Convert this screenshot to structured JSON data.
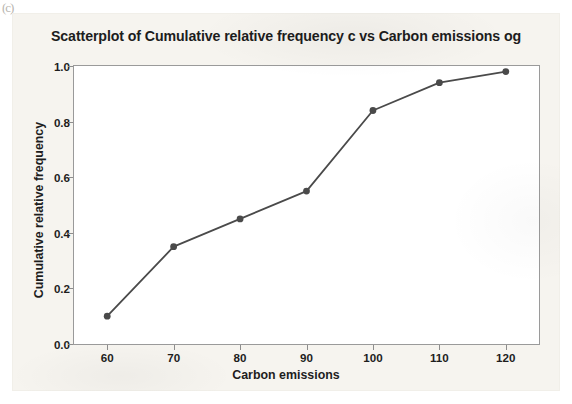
{
  "page": {
    "corner_artifact": "(c)"
  },
  "chart_data": {
    "type": "line",
    "title": "Scatterplot of Cumulative relative frequency c vs Carbon emissions og",
    "xlabel": "Carbon emissions",
    "ylabel": "Cumulative relative frequency",
    "x": [
      60,
      70,
      80,
      90,
      100,
      110,
      120
    ],
    "values": [
      0.1,
      0.35,
      0.45,
      0.55,
      0.84,
      0.94,
      0.98
    ],
    "series": [
      {
        "name": "Cumulative relative frequency",
        "values": [
          0.1,
          0.35,
          0.45,
          0.55,
          0.84,
          0.94,
          0.98
        ]
      }
    ],
    "xlim": [
      55,
      125
    ],
    "ylim": [
      0.0,
      1.0
    ],
    "xticks": [
      60,
      70,
      80,
      90,
      100,
      110,
      120
    ],
    "xticklabels": [
      "60",
      "70",
      "80",
      "90",
      "100",
      "110",
      "120"
    ],
    "yticks": [
      0.0,
      0.2,
      0.4,
      0.6,
      0.8,
      1.0
    ],
    "yticklabels": [
      "0.0",
      "0.2",
      "0.4",
      "0.6",
      "0.8",
      "1.0"
    ],
    "grid": false,
    "legend": false,
    "marker": "circle",
    "line_color": "#4a4a4a",
    "marker_color": "#4a4a4a",
    "plot_bg": "#ffffff",
    "figure_bg": "#f6f4ef",
    "frame_color": "#9a9a9a"
  }
}
